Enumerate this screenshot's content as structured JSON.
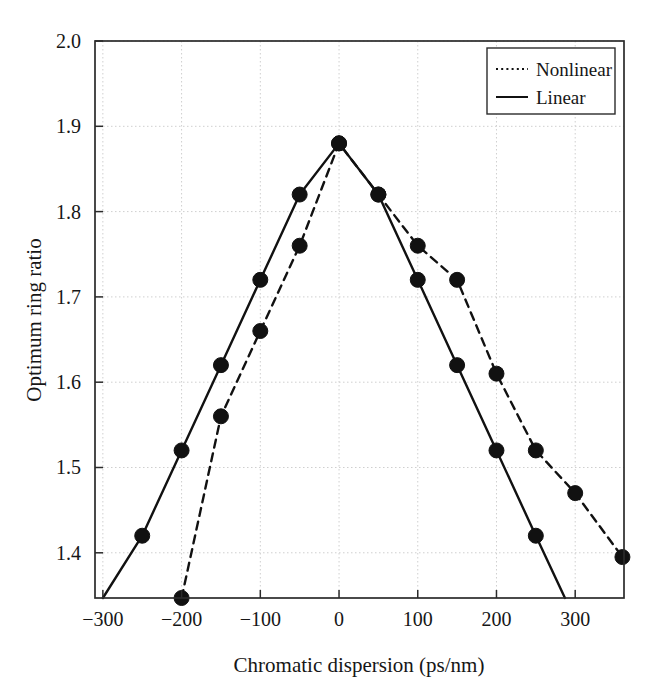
{
  "chart_data": {
    "type": "line",
    "title": "",
    "xlabel": "Chromatic dispersion (ps/nm)",
    "ylabel": "Optimum ring ratio",
    "xlim": [
      -310,
      362
    ],
    "ylim": [
      1.347,
      2.0
    ],
    "xticks": [
      -300,
      -200,
      -100,
      0,
      100,
      200,
      300
    ],
    "xticklabels": [
      "−300",
      "−200",
      "−100",
      "0",
      "100",
      "200",
      "300"
    ],
    "yticks": [
      1.4,
      1.5,
      1.6,
      1.7,
      1.8,
      1.9,
      2.0
    ],
    "yticklabels": [
      "1.4",
      "1.5",
      "1.6",
      "1.7",
      "1.8",
      "1.9",
      "2.0"
    ],
    "grid": true,
    "grid_style": "dotted",
    "legend_position": "top-right",
    "marker": "filled-circle",
    "series": [
      {
        "name": "Nonlinear",
        "style": "dashed",
        "color": "#111111",
        "x": [
          -200,
          -150,
          -100,
          -50,
          0,
          50,
          100,
          150,
          200,
          250,
          300,
          360
        ],
        "y": [
          1.347,
          1.56,
          1.66,
          1.76,
          1.88,
          1.82,
          1.76,
          1.72,
          1.61,
          1.52,
          1.47,
          1.395
        ]
      },
      {
        "name": "Linear",
        "style": "solid",
        "color": "#111111",
        "x": [
          -300,
          -250,
          -200,
          -150,
          -100,
          -50,
          0,
          50,
          100,
          150,
          200,
          250,
          287
        ],
        "y": [
          1.347,
          1.42,
          1.52,
          1.62,
          1.72,
          1.82,
          1.88,
          1.82,
          1.72,
          1.62,
          1.52,
          1.42,
          1.347
        ]
      }
    ],
    "marker_points": {
      "Nonlinear": [
        {
          "x": -200,
          "y": 1.347
        },
        {
          "x": -150,
          "y": 1.56
        },
        {
          "x": -100,
          "y": 1.66
        },
        {
          "x": -50,
          "y": 1.76
        },
        {
          "x": 0,
          "y": 1.88
        },
        {
          "x": 50,
          "y": 1.82
        },
        {
          "x": 100,
          "y": 1.76
        },
        {
          "x": 150,
          "y": 1.72
        },
        {
          "x": 200,
          "y": 1.61
        },
        {
          "x": 250,
          "y": 1.52
        },
        {
          "x": 300,
          "y": 1.47
        },
        {
          "x": 360,
          "y": 1.395
        }
      ],
      "Linear": [
        {
          "x": -250,
          "y": 1.42
        },
        {
          "x": -200,
          "y": 1.52
        },
        {
          "x": -150,
          "y": 1.62
        },
        {
          "x": -100,
          "y": 1.72
        },
        {
          "x": -50,
          "y": 1.82
        },
        {
          "x": 0,
          "y": 1.88
        },
        {
          "x": 50,
          "y": 1.82
        },
        {
          "x": 100,
          "y": 1.72
        },
        {
          "x": 150,
          "y": 1.62
        },
        {
          "x": 200,
          "y": 1.52
        },
        {
          "x": 250,
          "y": 1.42
        }
      ]
    }
  },
  "legend": {
    "entries": [
      {
        "label": "Nonlinear",
        "style": "dashed"
      },
      {
        "label": "Linear",
        "style": "solid"
      }
    ]
  },
  "axes": {
    "x_title": "Chromatic dispersion (ps/nm)",
    "y_title": "Optimum ring ratio"
  }
}
